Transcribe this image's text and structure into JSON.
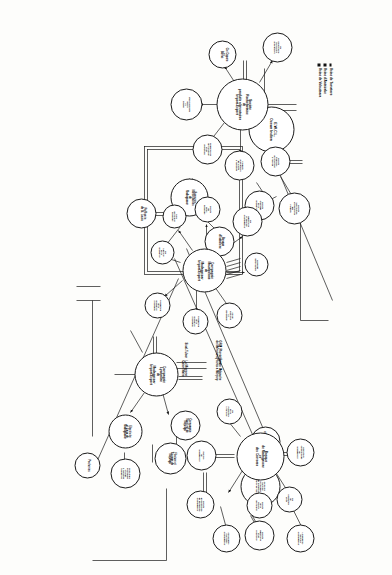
{
  "figure": {
    "orientation": "rotated-90",
    "line_color": "#1a1a1a",
    "node_fill": "#ffffff"
  },
  "nodes": [
    {
      "id": "ewcl",
      "label": "E.W.C.L.\nOcean Indien"
    },
    {
      "id": "srpa",
      "label": "Societe\nRochefortaise\nde\nproduits alimentaires\nImport-Export"
    },
    {
      "id": "cons_spec",
      "label": "Ste\nConserverie\nspecialites\nalimentaires"
    },
    {
      "id": "duparc",
      "label": "Cie Duparc\net\nBarrat"
    },
    {
      "id": "etab_g",
      "label": "Etablissements\nGuyot\net\nChanel"
    },
    {
      "id": "conserv_v",
      "label": "Conserveries\nde Tamatave\net de\nVoloutsara"
    },
    {
      "id": "pdts_alim",
      "label": "Produits\nalimentaires\nde la cote\na Tamatave"
    },
    {
      "id": "soc_franc",
      "label": "Societe\nFrancaise\nd'Armement\na l'Ocean"
    },
    {
      "id": "soc_val",
      "label": "Societe\nValorisation\net Commerce\ndes\nProduits"
    },
    {
      "id": "soc_ch",
      "label": "Societe\nChimique\nde la\nGrande Ile"
    },
    {
      "id": "bq_indo",
      "label": "Banque\nd'Indochine"
    },
    {
      "id": "sucr_mars",
      "label": "Sucreries\nMarseillaises\nde\nMadagascar"
    },
    {
      "id": "raff_stl",
      "label": "Raffinerie\nde St. Louis"
    },
    {
      "id": "cie_sucr",
      "label": "Cie\nSucriere\nde la\nGrande Ile"
    },
    {
      "id": "cmm",
      "label": "Compagnie\nMauricienne\nde\nMadagascar\nImport-Export"
    },
    {
      "id": "cie_sisal",
      "label": "Cie\nindustrielle\net agricole\na Madagascar"
    },
    {
      "id": "soc_betail",
      "label": "Societe\ndu\nbetail\nmalgache"
    },
    {
      "id": "sisal_m",
      "label": "Sisal\nde l'Ouest\nmalgache"
    },
    {
      "id": "moteurs",
      "label": "Malgache\nmotorisation"
    },
    {
      "id": "ste_mat",
      "label": "Ste de\nmateriels\net\nd'outillage"
    },
    {
      "id": "prod_mad",
      "label": "Production\nde la\nGrande Ile\na Majunga"
    },
    {
      "id": "worms",
      "label": "Worms\net Compagnie"
    },
    {
      "id": "cmn",
      "label": "Comptoir\nMaritime\nNormandie\nde Navigation\nPecherie de l'Ocean"
    },
    {
      "id": "longchamp",
      "label": "Longchamp\nmaritime\na Madagascar"
    },
    {
      "id": "assur_mar",
      "label": "Assurances\nmaritimes\na Madagascar"
    },
    {
      "id": "bmc",
      "label": "Banque\nde Madagascar\net\ndes Comores"
    },
    {
      "id": "ste_expl",
      "label": "Societe\nd'exploitation\nde navigation\na Madagascar"
    },
    {
      "id": "cie_navg",
      "label": "Cie\nde\nNavigation\nMixte"
    },
    {
      "id": "sirama",
      "label": "Societe\nde la\nRiziere\nde l'Ouest"
    },
    {
      "id": "rizerie",
      "label": "Rizeries\nde\nMadagascar"
    },
    {
      "id": "comm_mad",
      "label": "Comptoirs\ncommerciaux\nde\nMadagascar"
    },
    {
      "id": "soc_ind",
      "label": "Societe\nindustrielle\net de\ncommerce"
    },
    {
      "id": "ste_ppale",
      "label": "Ste\nde la\nPlantation\nprincipale"
    },
    {
      "id": "clm",
      "label": "Compagnie\nLyonnaise\nde\nMadagascar\nImport-Export"
    },
    {
      "id": "cie_mar_maj",
      "label": "Compagnie\nMaritime de\nMajunga"
    },
    {
      "id": "filature",
      "label": "Filature et\nTissage de\nMajunga"
    },
    {
      "id": "elec_eaux",
      "label": "Electricite\net Eaux de\nMadagascar"
    },
    {
      "id": "compteurs",
      "label": "Compteurs\nelectriques\net Eaux\na Tamatave\nTananarive"
    },
    {
      "id": "pecheries",
      "label": "Pecheries"
    }
  ],
  "legend_top": {
    "items": [
      "Usine de Tamatave",
      "Usine d'Antsirabe",
      "Usine de Voloutsara"
    ]
  },
  "legend_middle": {
    "items": [
      "GRM (Plantations\nde Mahanoro)",
      "Ferme Malgache\nPlants a Manjary"
    ]
  },
  "legend_lower": {
    "items": [
      "Sisal-Tulear",
      "La Mignone\nCoton Mahe"
    ]
  }
}
